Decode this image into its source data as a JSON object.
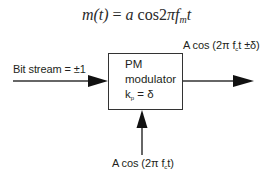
{
  "equation": {
    "lhs": "m(t)",
    "equals": "=",
    "rhs_coeff": "a",
    "rhs_func": "cos",
    "rhs_const": "2",
    "rhs_pi": "π",
    "rhs_f": "f",
    "rhs_f_sub": "m",
    "rhs_t": "t"
  },
  "input": {
    "label": "Bit stream = ±1"
  },
  "block": {
    "title": "PM",
    "subtitle": "modulator",
    "gain_symbol": "k",
    "gain_sub": "p",
    "gain_rest": " = δ"
  },
  "output": {
    "label_prefix": "A cos (2π f",
    "label_sub": "c",
    "label_suffix": "t ±δ)"
  },
  "carrier": {
    "label_prefix": "A cos (2π f",
    "label_sub": "c",
    "label_suffix": "t)"
  },
  "colors": {
    "line": "#333333",
    "text": "#231f20",
    "background": "#ffffff"
  }
}
